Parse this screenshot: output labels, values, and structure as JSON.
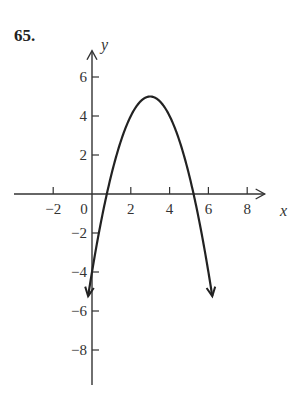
{
  "problem": {
    "number": "65."
  },
  "chart_data": {
    "type": "line",
    "title": "",
    "xlabel": "x",
    "ylabel": "y",
    "x_ticks": [
      -2,
      0,
      2,
      4,
      6,
      8
    ],
    "x_tick_labels": [
      "−2",
      "0",
      "2",
      "4",
      "6",
      "8"
    ],
    "y_ticks": [
      6,
      4,
      2,
      -2,
      -4,
      -6,
      -8
    ],
    "y_tick_labels": [
      "6",
      "4",
      "2",
      "−2",
      "−4",
      "−6",
      "−8"
    ],
    "xlim": [
      -3,
      8.9
    ],
    "ylim": [
      -9.8,
      7.5
    ],
    "grid": false,
    "legend": null,
    "series": [
      {
        "name": "parabola",
        "equation": "y = -(x-3)^2 + 5",
        "vertex": [
          3,
          5
        ],
        "x_intercepts": [
          0.76,
          5.24
        ],
        "y_intercept": -4,
        "x": [
          -0.2,
          0,
          0.5,
          1,
          1.5,
          2,
          2.5,
          3,
          3.5,
          4,
          4.5,
          5,
          5.5,
          6,
          6.2
        ],
        "y": [
          -5.24,
          -4,
          -1.25,
          1,
          2.75,
          4,
          4.75,
          5,
          4.75,
          4,
          2.75,
          1,
          -1.25,
          -4,
          -5.24
        ],
        "arrows_at_ends": true,
        "color": "#222222"
      }
    ]
  }
}
